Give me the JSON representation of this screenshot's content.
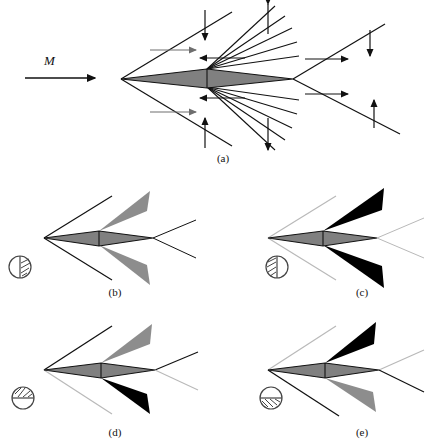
{
  "figure": {
    "type": "technical-diagram",
    "background_color": "#ffffff",
    "line_color": "#111111",
    "faint_line_color": "#b9b9b9",
    "airfoil_fill": "#808080",
    "fan_gray": "#8d8d8d",
    "fan_black": "#000000"
  },
  "freestream": {
    "label": "M",
    "arrow_name": "freestream-mach-arrow"
  },
  "panels": [
    {
      "id": "a",
      "caption": "(a)",
      "description": "Full wave pattern: leading-edge oblique shocks, mid-chord expansion fans, trailing-edge oblique shocks",
      "icon": null,
      "upper_fan_color": "none",
      "lower_fan_color": "none"
    },
    {
      "id": "b",
      "caption": "(b)",
      "icon": "circle-vertical-split-right-hatched",
      "upper_fan_color": "#8d8d8d",
      "lower_fan_color": "#8d8d8d",
      "shock_emphasis": "leading-edge-shocks-dark"
    },
    {
      "id": "c",
      "caption": "(c)",
      "icon": "circle-vertical-split-left-hatched",
      "upper_fan_color": "#000000",
      "lower_fan_color": "#000000",
      "shock_emphasis": "leading-edge-shocks-faint"
    },
    {
      "id": "d",
      "caption": "(d)",
      "icon": "circle-horizontal-split-top-hatched",
      "upper_fan_color": "#8d8d8d",
      "lower_fan_color": "#000000",
      "shock_emphasis": "upper-shock-dark-lower-shock-faint"
    },
    {
      "id": "e",
      "caption": "(e)",
      "icon": "circle-horizontal-split-bottom-hatched",
      "upper_fan_color": "#000000",
      "lower_fan_color": "#8d8d8d",
      "shock_emphasis": "lower-shock-dark-upper-shock-faint"
    }
  ]
}
